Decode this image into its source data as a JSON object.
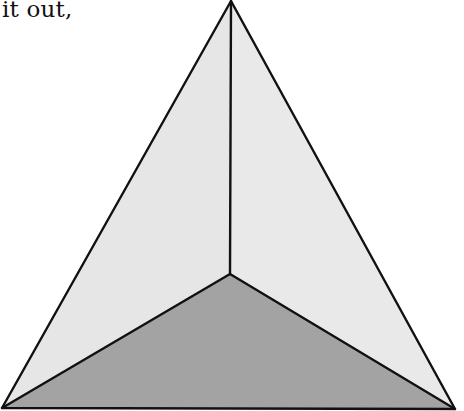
{
  "caption": {
    "text": "it out,"
  },
  "figure": {
    "type": "tetrahedron-top-view",
    "vertices": {
      "apex": [
        231,
        1
      ],
      "bottom_left": [
        2,
        408
      ],
      "bottom_right": [
        455,
        409
      ],
      "center": [
        230,
        274
      ]
    },
    "faces": [
      {
        "name": "left-face",
        "fill": "#e6e6e6"
      },
      {
        "name": "right-face",
        "fill": "#e9e9e9"
      },
      {
        "name": "bottom-face",
        "fill": "#a3a3a3"
      }
    ],
    "stroke": "#111111"
  }
}
